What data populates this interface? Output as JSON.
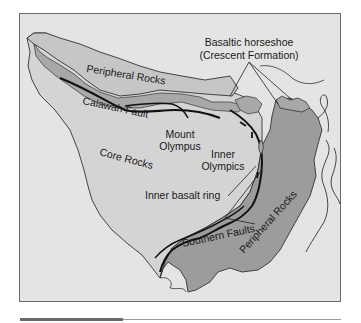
{
  "figure": {
    "colors": {
      "frame_bg": "#e4e4e4",
      "core_rocks": "#d2d2d2",
      "peripheral_rocks": "#c6c6c6",
      "peripheral_rocks_dark": "#9c9c9c",
      "basalt": "#a8a8a8",
      "fault_line": "#111111",
      "outline": "#333333"
    }
  },
  "labels": {
    "basaltic_horseshoe_line1": "Basaltic horseshoe",
    "basaltic_horseshoe_line2": "(Crescent Formation)",
    "peripheral_rocks_north": "Peripheral  Rocks",
    "calawah_fault": "Calawah Fault",
    "mount_olympus_line1": "Mount",
    "mount_olympus_line2": "Olympus",
    "core_rocks": "Core  Rocks",
    "inner_olympics_line1": "Inner",
    "inner_olympics_line2": "Olympics",
    "inner_basalt_ring": "Inner basalt ring",
    "southern_faults": "Southern Faults",
    "peripheral_rocks_south": "Peripheral Rocks"
  }
}
